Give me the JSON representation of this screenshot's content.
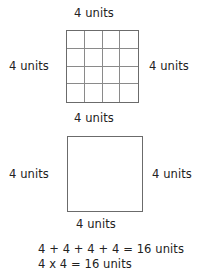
{
  "figure": {
    "gridded_square": {
      "label_top": "4 units",
      "label_left": "4 units",
      "label_right": "4 units",
      "label_bottom": "4 units",
      "columns": 4,
      "rows": 4,
      "cell_count": 16,
      "border_color": "#6b6b6b",
      "gridline_color": "#8a8a8a",
      "fill_color": "#ffffff"
    },
    "plain_square": {
      "label_left": "4 units",
      "label_right": "4 units",
      "label_bottom": "4 units",
      "border_color": "#6b6b6b",
      "fill_color": "#ffffff"
    },
    "equations": [
      "4 + 4 + 4 + 4 = 16 units",
      "4 x 4 = 16 units"
    ]
  },
  "chart_data": {
    "type": "diagram",
    "title": "",
    "shapes": [
      {
        "name": "gridded-square",
        "kind": "square",
        "side_length": 4,
        "side_unit": "units",
        "grid": {
          "columns": 4,
          "rows": 4,
          "cells": 16
        },
        "side_labels": {
          "top": "4 units",
          "left": "4 units",
          "right": "4 units",
          "bottom": "4 units"
        }
      },
      {
        "name": "plain-square",
        "kind": "square",
        "side_length": 4,
        "side_unit": "units",
        "grid": null,
        "side_labels": {
          "top": null,
          "left": "4 units",
          "right": "4 units",
          "bottom": "4 units"
        }
      }
    ],
    "annotations": [
      "4 + 4 + 4 + 4 = 16 units",
      "4 x 4 = 16 units"
    ],
    "result": 16,
    "result_unit": "units"
  }
}
